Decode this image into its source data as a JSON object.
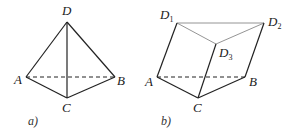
{
  "figures": [
    {
      "id": "a",
      "caption": "a)",
      "caption_pos": [
        28,
        125
      ],
      "vertices": {
        "D": {
          "label": "D",
          "pos": [
            67,
            22
          ],
          "label_pos": [
            62,
            15
          ]
        },
        "A": {
          "label": "A",
          "pos": [
            26,
            77
          ],
          "label_pos": [
            14,
            84
          ]
        },
        "B": {
          "label": "B",
          "pos": [
            115,
            77
          ],
          "label_pos": [
            117,
            85
          ]
        },
        "C": {
          "label": "C",
          "pos": [
            67,
            98
          ],
          "label_pos": [
            62,
            112
          ]
        }
      },
      "edges": [
        {
          "from": "D",
          "to": "A",
          "style": "solid"
        },
        {
          "from": "D",
          "to": "B",
          "style": "solid"
        },
        {
          "from": "D",
          "to": "C",
          "style": "solid"
        },
        {
          "from": "A",
          "to": "C",
          "style": "solid"
        },
        {
          "from": "C",
          "to": "B",
          "style": "solid"
        },
        {
          "from": "A",
          "to": "B",
          "style": "dashed"
        }
      ]
    },
    {
      "id": "b",
      "caption": "b)",
      "caption_pos": [
        161,
        125
      ],
      "vertices": {
        "D1": {
          "label": "D",
          "sub": "1",
          "pos": [
            177,
            23
          ],
          "label_pos": [
            160,
            19
          ]
        },
        "D2": {
          "label": "D",
          "sub": "2",
          "pos": [
            264,
            23
          ],
          "label_pos": [
            268,
            26
          ]
        },
        "D3": {
          "label": "D",
          "sub": "3",
          "pos": [
            216,
            44
          ],
          "label_pos": [
            219,
            57
          ]
        },
        "A": {
          "label": "A",
          "pos": [
            157,
            77
          ],
          "label_pos": [
            145,
            86
          ]
        },
        "B": {
          "label": "B",
          "pos": [
            245,
            77
          ],
          "label_pos": [
            249,
            86
          ]
        },
        "C": {
          "label": "C",
          "pos": [
            198,
            98
          ],
          "label_pos": [
            193,
            112
          ]
        }
      },
      "edges": [
        {
          "from": "D1",
          "to": "D2",
          "style": "light"
        },
        {
          "from": "D1",
          "to": "D3",
          "style": "light"
        },
        {
          "from": "D3",
          "to": "D2",
          "style": "light"
        },
        {
          "from": "D1",
          "to": "A",
          "style": "solid"
        },
        {
          "from": "D2",
          "to": "B",
          "style": "solid"
        },
        {
          "from": "D3",
          "to": "C",
          "style": "solid"
        },
        {
          "from": "A",
          "to": "C",
          "style": "solid"
        },
        {
          "from": "C",
          "to": "B",
          "style": "solid"
        },
        {
          "from": "A",
          "to": "B",
          "style": "dashed"
        }
      ]
    }
  ],
  "colors": {
    "stroke": "#222222",
    "light_stroke": "#888888",
    "background": "#ffffff"
  }
}
